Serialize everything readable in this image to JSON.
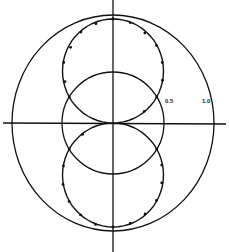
{
  "chart_data": {
    "type": "scatter",
    "title": "",
    "projection": "polar",
    "radial_ticks": [
      "0.5",
      "1.0"
    ],
    "reference_circles": [
      0.5,
      1.0
    ],
    "axes": {
      "horizontal": true,
      "vertical": true
    },
    "fit_curve": "r = |sin(theta)| relative to horizontal axis (lobes up and down)",
    "series": [
      {
        "name": "measured",
        "points_deg_r": [
          [
            90,
            1.0
          ],
          [
            80,
            0.98
          ],
          [
            100,
            0.97
          ],
          [
            70,
            0.92
          ],
          [
            110,
            0.93
          ],
          [
            60,
            0.86
          ],
          [
            120,
            0.84
          ],
          [
            50,
            0.76
          ],
          [
            130,
            0.76
          ],
          [
            40,
            0.64
          ],
          [
            140,
            0.62
          ],
          [
            30,
            0.5
          ],
          [
            150,
            0.5
          ],
          [
            20,
            0.33
          ],
          [
            270,
            1.0
          ],
          [
            260,
            0.99
          ],
          [
            280,
            0.98
          ],
          [
            250,
            0.94
          ],
          [
            290,
            0.93
          ],
          [
            240,
            0.87
          ],
          [
            300,
            0.86
          ],
          [
            230,
            0.77
          ],
          [
            310,
            0.75
          ],
          [
            220,
            0.64
          ],
          [
            320,
            0.63
          ],
          [
            210,
            0.5
          ],
          [
            330,
            0.5
          ],
          [
            200,
            0.32
          ]
        ]
      }
    ],
    "labels": {
      "inner": "0.5",
      "outer": "1.0"
    }
  }
}
